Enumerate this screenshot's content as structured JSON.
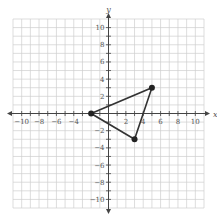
{
  "chart_data": {
    "type": "scatter",
    "title": "",
    "xlabel": "x",
    "ylabel": "y",
    "xlim": [
      -11,
      11
    ],
    "ylim": [
      -11,
      11
    ],
    "grid": true,
    "x_tick_labels": [
      -10,
      -8,
      -6,
      -4,
      2,
      4,
      6,
      8,
      10
    ],
    "y_tick_labels": [
      10,
      8,
      6,
      4,
      2,
      -2,
      -4,
      -6,
      -8,
      -10
    ],
    "points": [
      {
        "x": -2,
        "y": 0
      },
      {
        "x": 5,
        "y": 3
      },
      {
        "x": 3,
        "y": -3
      }
    ],
    "polygon": "triangle"
  }
}
